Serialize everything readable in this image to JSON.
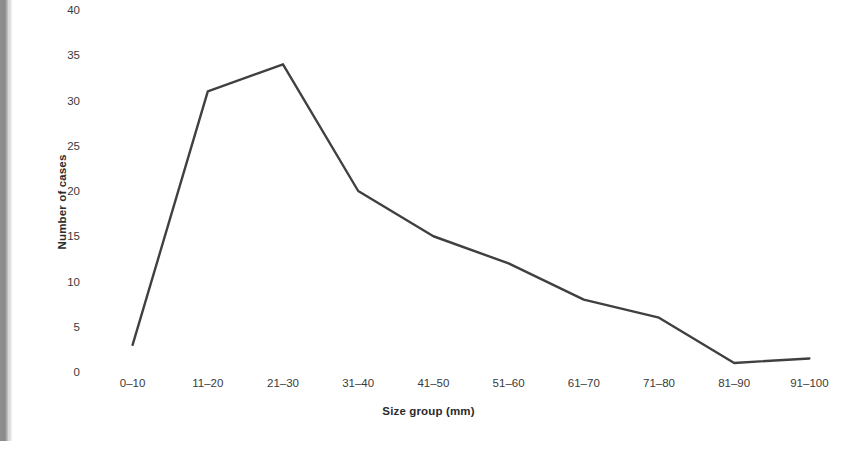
{
  "figure": {
    "background_color": "#ffffff",
    "gutter_color": "#8d8d8d",
    "line_color": "#404040"
  },
  "chart_data": {
    "type": "line",
    "title": "",
    "subtitle": "",
    "xlabel": "Size group (mm)",
    "ylabel": "Number of cases",
    "categories": [
      "0–10",
      "11–20",
      "21–30",
      "31–40",
      "41–50",
      "51–60",
      "61–70",
      "71–80",
      "81–90",
      "91–100"
    ],
    "values": [
      3,
      31,
      34,
      20,
      15,
      12,
      8,
      6,
      1,
      1.5
    ],
    "series": [
      {
        "name": "Number of cases",
        "values": [
          3,
          31,
          34,
          20,
          15,
          12,
          8,
          6,
          1,
          1.5
        ],
        "color": "#404040",
        "line_width": 2.4,
        "markers": false
      }
    ],
    "ylim": [
      0,
      40
    ],
    "yticks": [
      0,
      5,
      10,
      15,
      20,
      25,
      30,
      35,
      40
    ],
    "ytick_labels": [
      "0",
      "5",
      "10",
      "15",
      "20",
      "25",
      "30",
      "35",
      "40"
    ],
    "grid": false,
    "legend": false,
    "legend_position": "none",
    "axis_lines": false
  }
}
